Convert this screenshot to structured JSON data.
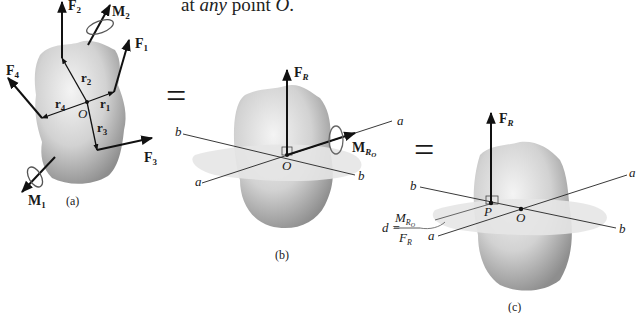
{
  "header_text": {
    "prefix": "at ",
    "emph": "any",
    "middle": " point ",
    "point": "O",
    "suffix": "."
  },
  "equals_sign": "=",
  "panels": [
    {
      "id": "a",
      "caption": "(a)",
      "point_label": "O",
      "forces": [
        {
          "name": "F",
          "sub": "1"
        },
        {
          "name": "F",
          "sub": "2"
        },
        {
          "name": "F",
          "sub": "3"
        },
        {
          "name": "F",
          "sub": "4"
        }
      ],
      "position_vectors": [
        {
          "name": "r",
          "sub": "1"
        },
        {
          "name": "r",
          "sub": "2"
        },
        {
          "name": "r",
          "sub": "3"
        },
        {
          "name": "r",
          "sub": "4"
        }
      ],
      "moments": [
        {
          "name": "M",
          "sub": "1"
        },
        {
          "name": "M",
          "sub": "2"
        }
      ]
    },
    {
      "id": "b",
      "caption": "(b)",
      "point_label": "O",
      "force": {
        "name": "F",
        "sub": "R"
      },
      "moment": {
        "name": "M",
        "sub": "R",
        "subsub": "O"
      },
      "axes": {
        "a": "a",
        "b": "b"
      }
    },
    {
      "id": "c",
      "caption": "(c)",
      "point_label": "O",
      "point_p_label": "P",
      "force": {
        "name": "F",
        "sub": "R"
      },
      "axes": {
        "a": "a",
        "b": "b"
      },
      "distance_formula": {
        "lhs": "d =",
        "numerator": "M",
        "num_sub": "R",
        "num_subsub": "O",
        "denominator": "F",
        "den_sub": "R"
      }
    }
  ],
  "colors": {
    "body_light": "#ededed",
    "body_dark": "#9a9a9a",
    "plane": "#e4e4e4",
    "ink": "#111111"
  }
}
